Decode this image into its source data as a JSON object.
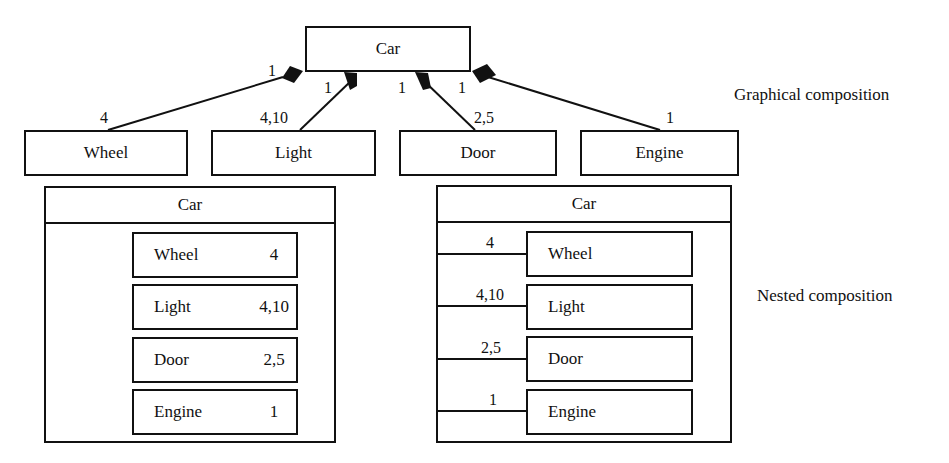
{
  "graphical": {
    "whole": "Car",
    "parts": [
      {
        "name": "Wheel",
        "whole_multiplicity": "1",
        "part_multiplicity": "4"
      },
      {
        "name": "Light",
        "whole_multiplicity": "1",
        "part_multiplicity": "4,10"
      },
      {
        "name": "Door",
        "whole_multiplicity": "1",
        "part_multiplicity": "2,5"
      },
      {
        "name": "Engine",
        "whole_multiplicity": "1",
        "part_multiplicity": "1"
      }
    ],
    "label": "Graphical composition"
  },
  "nested_left": {
    "whole": "Car",
    "parts": [
      {
        "name": "Wheel",
        "multiplicity": "4"
      },
      {
        "name": "Light",
        "multiplicity": "4,10"
      },
      {
        "name": "Door",
        "multiplicity": "2,5"
      },
      {
        "name": "Engine",
        "multiplicity": "1"
      }
    ]
  },
  "nested_right": {
    "whole": "Car",
    "parts": [
      {
        "name": "Wheel",
        "multiplicity": "4"
      },
      {
        "name": "Light",
        "multiplicity": "4,10"
      },
      {
        "name": "Door",
        "multiplicity": "2,5"
      },
      {
        "name": "Engine",
        "multiplicity": "1"
      }
    ]
  },
  "nested_label": "Nested composition"
}
